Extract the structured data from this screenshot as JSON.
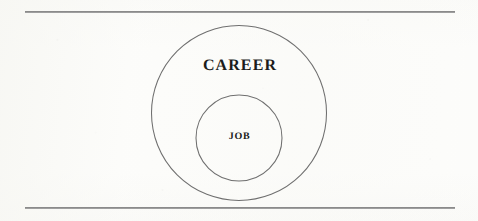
{
  "page": {
    "background_color": "#fcfcfa",
    "width": 478,
    "height": 221
  },
  "rules": {
    "line_color": "#8a8a8a",
    "top": {
      "name": "top-rule"
    },
    "bottom": {
      "name": "bottom-rule"
    }
  },
  "diagram": {
    "type": "nested-circles",
    "stroke_color": "#6f6f6f",
    "fill_color": "none",
    "outer_circle": {
      "label": "CAREER",
      "center_x": 239,
      "center_y": 113,
      "radius": 88
    },
    "inner_circle": {
      "label": "JOB",
      "center_x": 239,
      "center_y": 138,
      "radius": 43
    }
  },
  "chart_data": {
    "type": "diagram",
    "subtype": "euler-nested-sets",
    "title": "",
    "sets": [
      {
        "name": "CAREER",
        "level": 0,
        "contains": [
          "JOB"
        ]
      },
      {
        "name": "JOB",
        "level": 1,
        "contains": []
      }
    ],
    "labels": [
      "CAREER",
      "JOB"
    ],
    "relationship": "JOB is a proper subset of CAREER"
  }
}
